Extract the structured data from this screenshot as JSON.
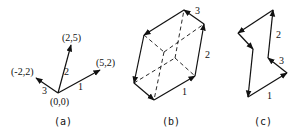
{
  "panels": {
    "a": {
      "caption": "(a)",
      "points": {
        "origin": "(0,0)",
        "p1": "(5,2)",
        "p2": "(2,5)",
        "p3": "(-2,2)"
      },
      "vector_labels": {
        "v1": "1",
        "v2": "2",
        "v3": "3"
      }
    },
    "b": {
      "caption": "(b)",
      "edge_labels": {
        "e1": "1",
        "e2": "2",
        "e3": "3"
      }
    },
    "c": {
      "caption": "(c)",
      "edge_labels": {
        "e1": "1",
        "e2": "2",
        "e3": "3"
      }
    }
  },
  "colors": {
    "ink": "#111111",
    "background": "#ffffff"
  }
}
